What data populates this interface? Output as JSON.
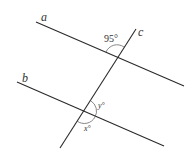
{
  "figure": {
    "type": "parallel lines cut by a transversal",
    "lines": {
      "a": "a",
      "b": "b",
      "c": "c"
    },
    "angles": {
      "top_angle": "95°",
      "angle_y": "y°",
      "angle_x": "x°"
    }
  }
}
